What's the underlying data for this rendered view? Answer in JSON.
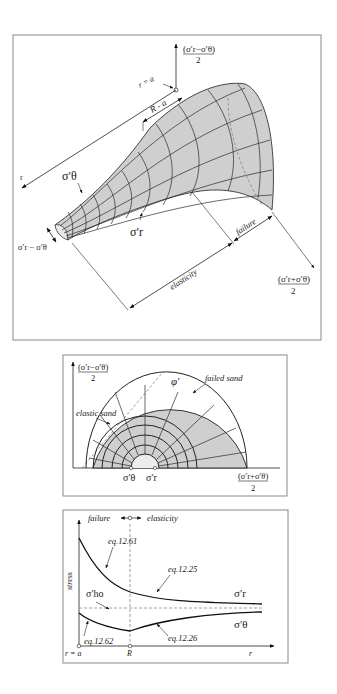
{
  "figure_top": {
    "y_axis_label_num": "(σ′r−σ′θ)",
    "y_axis_label_den": "2",
    "x_axis_label_num": "(σ′r+σ′θ)",
    "x_axis_label_den": "2",
    "r_axis_label": "r",
    "cavity_label": "r = a",
    "plastic_zone_label": "R - a",
    "sigma_theta_label": "σ′θ",
    "sigma_r_label": "σ′r",
    "deviator_label": "σ′r − σ′θ",
    "elasticity_label": "elasticity",
    "failure_label": "failure"
  },
  "figure_middle": {
    "y_axis_label_num": "(σ′r−σ′θ)",
    "y_axis_label_den": "2",
    "x_axis_label_num": "(σ′r+σ′θ)",
    "x_axis_label_den": "2",
    "phi_label": "φ′",
    "failed_sand_label": "failed sand",
    "elastic_sand_label": "elastic sand",
    "sigma_theta_label": "σ′θ",
    "sigma_r_label": "σ′r"
  },
  "figure_bottom": {
    "y_axis_label": "stress",
    "x_axis_label": "r",
    "origin_label": "r = a",
    "R_label": "R",
    "failure_label": "failure",
    "elasticity_label": "elasticity",
    "eq_1261": "eq.12.61",
    "eq_1225": "eq.12.25",
    "eq_1262": "eq.12.62",
    "eq_1226": "eq.12.26",
    "sigma_ho_label": "σ′ho",
    "sigma_r_label": "σ′r",
    "sigma_theta_label": "σ′θ"
  }
}
